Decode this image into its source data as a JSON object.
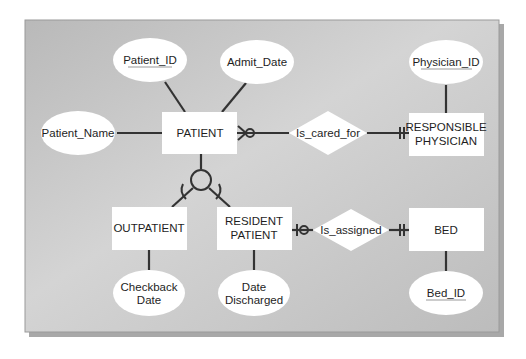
{
  "diagram": {
    "type": "entity-relationship",
    "colors": {
      "background": "#ffffff",
      "panel": "#bdbdbd",
      "panel_light": "#d6d6d6",
      "shape_fill": "#ffffff",
      "line": "#333333",
      "text": "#1e1e1e"
    },
    "entities": [
      {
        "id": "patient",
        "label": "PATIENT"
      },
      {
        "id": "responsible_physician",
        "label_line1": "RESPONSIBLE",
        "label_line2": "PHYSICIAN"
      },
      {
        "id": "outpatient",
        "label": "OUTPATIENT"
      },
      {
        "id": "resident_patient",
        "label_line1": "RESIDENT",
        "label_line2": "PATIENT"
      },
      {
        "id": "bed",
        "label": "BED"
      }
    ],
    "attributes": {
      "patient_id": "Patient_ID",
      "admit_date": "Admit_Date",
      "patient_name": "Patient_Name",
      "physician_id": "Physician_ID",
      "checkback_date_line1": "Checkback",
      "checkback_date_line2": "Date",
      "date_discharged_line1": "Date",
      "date_discharged_line2": "Discharged",
      "bed_id": "Bed_ID"
    },
    "relationships": [
      {
        "id": "is_cared_for",
        "label": "Is_cared_for",
        "from": "PATIENT",
        "from_cardinality": "zero-or-many",
        "to": "RESPONSIBLE PHYSICIAN",
        "to_cardinality": "one-and-only-one"
      },
      {
        "id": "is_assigned",
        "label": "Is_assigned",
        "from": "RESIDENT PATIENT",
        "from_cardinality": "zero-or-one",
        "to": "BED",
        "to_cardinality": "one-and-only-one"
      }
    ],
    "generalization": {
      "supertype": "PATIENT",
      "subtypes": [
        "OUTPATIENT",
        "RESIDENT PATIENT"
      ]
    }
  }
}
